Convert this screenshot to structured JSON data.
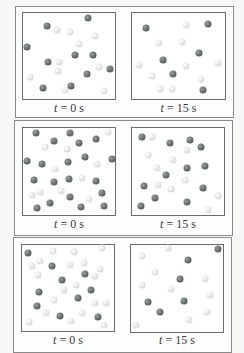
{
  "figure": {
    "panels": [
      {
        "left_label": {
          "var": "t",
          "eq": " = 0 s"
        },
        "right_label": {
          "var": "t",
          "eq": " = 15 s"
        },
        "left_box": {
          "dark": [
            [
              88,
              18
            ],
            [
              47,
              26
            ],
            [
              27,
              47
            ],
            [
              48,
              62
            ],
            [
              75,
              55
            ],
            [
              93,
              55
            ],
            [
              110,
              69
            ],
            [
              87,
              74
            ],
            [
              43,
              88
            ],
            [
              71,
              86
            ]
          ],
          "light": [
            [
              57,
              30
            ],
            [
              70,
              32
            ],
            [
              95,
              36
            ],
            [
              79,
              44
            ],
            [
              59,
              62
            ],
            [
              58,
              71
            ],
            [
              99,
              67
            ],
            [
              30,
              77
            ],
            [
              65,
              90
            ],
            [
              104,
              91
            ]
          ]
        },
        "right_box": {
          "dark": [
            [
              146,
              28
            ],
            [
              208,
              24
            ],
            [
              199,
              53
            ],
            [
              163,
              60
            ],
            [
              173,
              74
            ],
            [
              203,
              90
            ]
          ],
          "light": [
            [
              186,
              25
            ],
            [
              159,
              43
            ],
            [
              182,
              42
            ],
            [
              218,
              63
            ],
            [
              139,
              65
            ],
            [
              186,
              66
            ],
            [
              152,
              76
            ],
            [
              201,
              79
            ],
            [
              160,
              89
            ],
            [
              172,
              89
            ]
          ]
        }
      },
      {
        "left_label": {
          "var": "t",
          "eq": " = 0 s"
        },
        "right_label": {
          "var": "t",
          "eq": " = 15 s"
        },
        "left_box": {
          "dark": [
            [
              36,
              133
            ],
            [
              70,
              133
            ],
            [
              54,
              141
            ],
            [
              79,
              143
            ],
            [
              96,
              139
            ],
            [
              27,
              161
            ],
            [
              42,
              164
            ],
            [
              68,
              162
            ],
            [
              85,
              157
            ],
            [
              112,
              159
            ],
            [
              34,
              180
            ],
            [
              54,
              182
            ],
            [
              69,
              179
            ],
            [
              96,
              181
            ],
            [
              102,
              193
            ],
            [
              70,
              197
            ],
            [
              50,
              203
            ],
            [
              37,
              208
            ],
            [
              81,
              207
            ],
            [
              104,
              206
            ]
          ],
          "light": [
            [
              108,
              132
            ],
            [
              45,
              147
            ],
            [
              67,
              149
            ],
            [
              55,
              169
            ],
            [
              97,
              164
            ],
            [
              82,
              178
            ],
            [
              32,
              195
            ],
            [
              40,
              192
            ],
            [
              61,
              191
            ],
            [
              89,
              199
            ]
          ]
        },
        "right_box": {
          "dark": [
            [
              142,
              137
            ],
            [
              170,
              143
            ],
            [
              190,
              140
            ],
            [
              201,
              147
            ],
            [
              187,
              168
            ],
            [
              205,
              166
            ],
            [
              166,
              175
            ],
            [
              144,
              186
            ],
            [
              203,
              188
            ],
            [
              155,
              198
            ],
            [
              187,
              202
            ],
            [
              141,
              206
            ]
          ],
          "light": [
            [
              152,
              137
            ],
            [
              187,
              150
            ],
            [
              148,
              155
            ],
            [
              173,
              160
            ],
            [
              157,
              168
            ],
            [
              158,
              185
            ],
            [
              185,
              180
            ],
            [
              171,
              189
            ],
            [
              218,
              196
            ],
            [
              208,
              210
            ]
          ]
        }
      },
      {
        "left_label": {
          "var": "t",
          "eq": " = 0 s"
        },
        "right_label": {
          "var": "t",
          "eq": " = 15 s"
        },
        "left_box": {
          "dark": [
            [
              28,
              253
            ],
            [
              52,
              266
            ],
            [
              62,
              280
            ],
            [
              85,
              274
            ],
            [
              39,
              292
            ],
            [
              91,
              290
            ],
            [
              78,
              298
            ],
            [
              37,
              306
            ],
            [
              60,
              316
            ],
            [
              98,
              317
            ]
          ],
          "light": [
            [
              53,
              251
            ],
            [
              74,
              252
            ],
            [
              102,
              248
            ],
            [
              32,
              266
            ],
            [
              40,
              261
            ],
            [
              70,
              265
            ],
            [
              84,
              263
            ],
            [
              38,
              275
            ],
            [
              95,
              276
            ],
            [
              100,
              269
            ],
            [
              64,
              290
            ],
            [
              76,
              285
            ],
            [
              54,
              300
            ],
            [
              95,
              303
            ],
            [
              106,
              303
            ],
            [
              46,
              313
            ],
            [
              82,
              313
            ],
            [
              71,
              321
            ],
            [
              29,
              322
            ],
            [
              104,
              325
            ]
          ]
        },
        "right_box": {
          "dark": [
            [
              218,
              249
            ],
            [
              188,
              260
            ],
            [
              180,
              279
            ],
            [
              148,
              302
            ],
            [
              184,
              301
            ],
            [
              160,
              312
            ]
          ],
          "light": [
            [
              168,
              248
            ],
            [
              142,
              256
            ],
            [
              155,
              272
            ],
            [
              205,
              279
            ],
            [
              142,
              285
            ],
            [
              171,
              289
            ],
            [
              210,
              295
            ],
            [
              207,
              312
            ],
            [
              189,
              320
            ],
            [
              136,
              325
            ]
          ]
        }
      }
    ],
    "colors": {
      "dark_sphere": "#5f6862",
      "light_sphere": "#e2e4e0",
      "border": "#6b6b6b"
    }
  }
}
